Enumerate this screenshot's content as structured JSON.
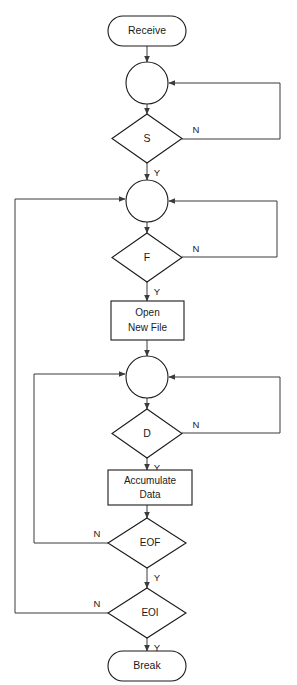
{
  "diagram": {
    "type": "flowchart",
    "canvas": {
      "width": 297,
      "height": 685
    },
    "nodes": [
      {
        "id": "receive",
        "shape": "terminal",
        "label": "Receive"
      },
      {
        "id": "connector1",
        "shape": "connector",
        "label": ""
      },
      {
        "id": "decision_s",
        "shape": "decision",
        "label": "S"
      },
      {
        "id": "connector2",
        "shape": "connector",
        "label": ""
      },
      {
        "id": "decision_f",
        "shape": "decision",
        "label": "F"
      },
      {
        "id": "open_new_file",
        "shape": "process",
        "label_line1": "Open",
        "label_line2": "New File"
      },
      {
        "id": "connector3",
        "shape": "connector",
        "label": ""
      },
      {
        "id": "decision_d",
        "shape": "decision",
        "label": "D"
      },
      {
        "id": "accumulate_data",
        "shape": "process",
        "label_line1": "Accumulate",
        "label_line2": "Data"
      },
      {
        "id": "decision_eof",
        "shape": "decision",
        "label": "EOF"
      },
      {
        "id": "decision_eoi",
        "shape": "decision",
        "label": "EOI"
      },
      {
        "id": "break",
        "shape": "terminal",
        "label": "Break"
      }
    ],
    "edge_labels": {
      "s_no": "N",
      "s_yes": "Y",
      "f_no": "N",
      "f_yes": "Y",
      "d_no": "N",
      "d_yes": "Y",
      "eof_no": "N",
      "eof_yes": "Y",
      "eoi_no": "N",
      "eoi_yes": "Y"
    },
    "colors": {
      "stroke": "#1a1a1a",
      "connector_stroke": "#3b3b3b",
      "fill": "#ffffff",
      "text": "#1a1a1a"
    }
  }
}
